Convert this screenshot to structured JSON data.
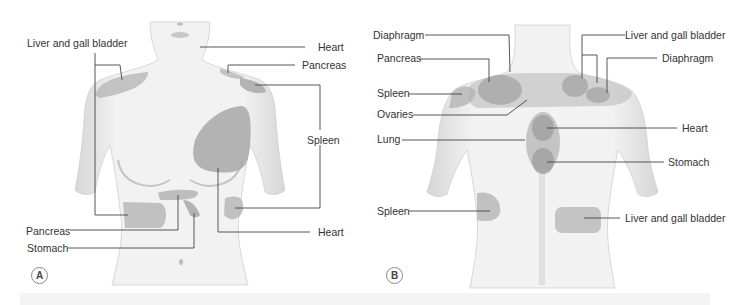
{
  "figure_a": {
    "panel_letter": "A",
    "view": "anterior",
    "labels": {
      "liver_gall_bladder": "Liver and gall bladder",
      "heart_top": "Heart",
      "pancreas_top": "Pancreas",
      "spleen": "Spleen",
      "pancreas_bottom": "Pancreas",
      "stomach": "Stomach",
      "heart_bottom": "Heart"
    }
  },
  "figure_b": {
    "panel_letter": "B",
    "view": "posterior",
    "labels": {
      "diaphragm_left": "Diaphragm",
      "pancreas": "Pancreas",
      "spleen_top": "Spleen",
      "ovaries": "Ovaries",
      "lung": "Lung",
      "spleen_bottom": "Spleen",
      "liver_gall_bladder_top": "Liver and gall bladder",
      "diaphragm_right": "Diaphragm",
      "heart": "Heart",
      "stomach": "Stomach",
      "liver_gall_bladder_bottom": "Liver and gall bladder"
    }
  },
  "colors": {
    "skin": "#f0f0f0",
    "skin_shadow": "#d8d8d8",
    "region": "#b4b4b4",
    "region_dark": "#a0a0a0",
    "leader_line": "#444444",
    "text": "#333333"
  }
}
